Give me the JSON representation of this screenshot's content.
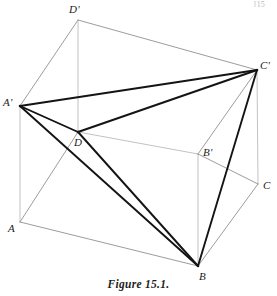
{
  "figure": {
    "caption": "Figure 15.1.",
    "page_marker": "[15",
    "colors": {
      "cube_edge": "#8a8a8a",
      "hidden_edge": "#b3b3b3",
      "tetra_edge": "#141414",
      "label_text": "#1a1a1a",
      "background": "#ffffff"
    },
    "labels": [
      {
        "name": "D-prime",
        "text": "D'",
        "x": 69,
        "y": 4
      },
      {
        "name": "C-prime",
        "text": "C'",
        "x": 260,
        "y": 60
      },
      {
        "name": "A-prime",
        "text": "A'",
        "x": 3,
        "y": 97
      },
      {
        "name": "D",
        "text": "D",
        "x": 74,
        "y": 137
      },
      {
        "name": "B-prime",
        "text": "B'",
        "x": 203,
        "y": 147
      },
      {
        "name": "C",
        "text": "C",
        "x": 263,
        "y": 180
      },
      {
        "name": "A",
        "text": "A",
        "x": 8,
        "y": 223
      },
      {
        "name": "B",
        "text": "B",
        "x": 199,
        "y": 271
      }
    ],
    "vertices": {
      "A": {
        "x": 20,
        "y": 222
      },
      "B": {
        "x": 198,
        "y": 266
      },
      "C": {
        "x": 258,
        "y": 184
      },
      "D": {
        "x": 78,
        "y": 132
      },
      "Ap": {
        "x": 20,
        "y": 106
      },
      "Bp": {
        "x": 198,
        "y": 154
      },
      "Cp": {
        "x": 257,
        "y": 70
      },
      "Dp": {
        "x": 78,
        "y": 20
      }
    },
    "cube_edges": [
      {
        "name": "edge-Dp-Ap",
        "from": "Dp",
        "to": "Ap",
        "style": "visible"
      },
      {
        "name": "edge-Dp-Cp",
        "from": "Dp",
        "to": "Cp",
        "style": "visible"
      },
      {
        "name": "edge-Dp-D",
        "from": "Dp",
        "to": "D",
        "style": "hidden"
      },
      {
        "name": "edge-Ap-A",
        "from": "Ap",
        "to": "A",
        "style": "hidden"
      },
      {
        "name": "edge-Ap-D",
        "from": "Ap",
        "to": "D",
        "style": "visible"
      },
      {
        "name": "edge-D-Bp",
        "from": "D",
        "to": "Bp",
        "style": "hidden"
      },
      {
        "name": "edge-Cp-Bp",
        "from": "Cp",
        "to": "Bp",
        "style": "visible"
      },
      {
        "name": "edge-Cp-C",
        "from": "Cp",
        "to": "C",
        "style": "hidden"
      },
      {
        "name": "edge-Bp-B",
        "from": "Bp",
        "to": "B",
        "style": "hidden"
      },
      {
        "name": "edge-Bp-C",
        "from": "Bp",
        "to": "C",
        "style": "visible"
      },
      {
        "name": "edge-A-D",
        "from": "A",
        "to": "D",
        "style": "visible"
      },
      {
        "name": "edge-A-B",
        "from": "A",
        "to": "B",
        "style": "visible"
      },
      {
        "name": "edge-B-C",
        "from": "B",
        "to": "C",
        "style": "visible"
      }
    ],
    "tetrahedron_edges": [
      {
        "name": "tetra-edge-Ap-Cp",
        "from": "Ap",
        "to": "Cp"
      },
      {
        "name": "tetra-edge-Ap-D",
        "from": "Ap",
        "to": "D"
      },
      {
        "name": "tetra-edge-Ap-B",
        "from": "Ap",
        "to": "B"
      },
      {
        "name": "tetra-edge-Cp-D",
        "from": "Cp",
        "to": "D"
      },
      {
        "name": "tetra-edge-Cp-B",
        "from": "Cp",
        "to": "B"
      },
      {
        "name": "tetra-edge-D-B",
        "from": "D",
        "to": "B"
      }
    ]
  }
}
